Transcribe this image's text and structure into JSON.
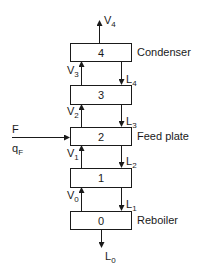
{
  "diagram": {
    "title": "",
    "plates": [
      {
        "number": "4",
        "name": "Condenser"
      },
      {
        "number": "3",
        "name": ""
      },
      {
        "number": "2",
        "name": "Feed plate"
      },
      {
        "number": "1",
        "name": ""
      },
      {
        "number": "0",
        "name": "Reboiler"
      }
    ],
    "vapor_streams": [
      {
        "symbol": "V",
        "subscript": "4"
      },
      {
        "symbol": "V",
        "subscript": "3"
      },
      {
        "symbol": "V",
        "subscript": "2"
      },
      {
        "symbol": "V",
        "subscript": "1"
      },
      {
        "symbol": "V",
        "subscript": "0"
      }
    ],
    "liquid_streams": [
      {
        "symbol": "L",
        "subscript": "4"
      },
      {
        "symbol": "L",
        "subscript": "3"
      },
      {
        "symbol": "L",
        "subscript": "2"
      },
      {
        "symbol": "L",
        "subscript": "1"
      },
      {
        "symbol": "L",
        "subscript": "0"
      }
    ],
    "feed": {
      "label": "F",
      "quality_symbol": "q",
      "quality_subscript": "F"
    },
    "colors": {
      "line": "#1a1a1a",
      "background": "#ffffff"
    }
  }
}
